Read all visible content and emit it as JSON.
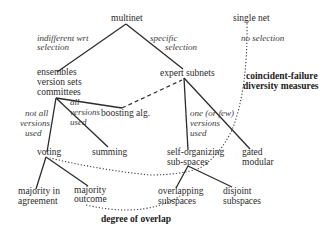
{
  "nodes": {
    "multinet": "multinet",
    "single_net": "single net",
    "ensembles": [
      "ensembles",
      "version sets",
      "committees"
    ],
    "expert_subnets": "expert subnets",
    "boosting": "boosting alg.",
    "voting": "voting",
    "summing": "summing",
    "self_organizing": [
      "self-organizing",
      "sub-spaces"
    ],
    "gated_modular": [
      "gated",
      "modular"
    ],
    "majority_agreement": [
      "majority in",
      "agreement"
    ],
    "majority_outcome": [
      "majority",
      "outcome"
    ],
    "overlapping": [
      "overlapping",
      "subspaces"
    ],
    "disjoint": [
      "disjoint",
      "subspaces"
    ]
  },
  "edge_labels": {
    "indifferent": [
      "indifferent  wrt",
      "selection"
    ],
    "specific": [
      "specific",
      "selection"
    ],
    "no_selection": "no selection",
    "not_all": [
      "not  all",
      "versions",
      "used"
    ],
    "all": [
      "all",
      "versions",
      "used"
    ],
    "one_or_few": [
      "one (or   few)",
      "versions",
      "used"
    ]
  },
  "annotations": {
    "coincident": [
      "coincident-failure",
      "diversity  measures"
    ],
    "overlap": "degree of overlap"
  }
}
